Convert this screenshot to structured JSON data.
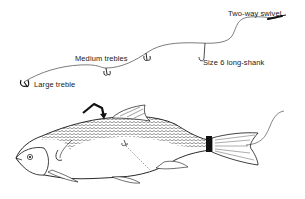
{
  "diagram": {
    "type": "fishing-rig-illustration",
    "labels": {
      "swivel": "Two-way swivel",
      "single_hook": "Size 6 long-shank",
      "medium": "Medium trebles",
      "large": "Large treble"
    },
    "components": [
      {
        "name": "Two-way swivel",
        "position": "top-right"
      },
      {
        "name": "Size 6 long-shank",
        "kind": "single hook"
      },
      {
        "name": "Medium trebles",
        "count": 2
      },
      {
        "name": "Large treble",
        "position": "bottom-left"
      }
    ],
    "illustration": "Dead-bait fish mounted on the rig, with an arrow pointing to the back behind the head",
    "colors": {
      "line": "#333333",
      "ink": "#111111",
      "background": "#ffffff"
    }
  }
}
